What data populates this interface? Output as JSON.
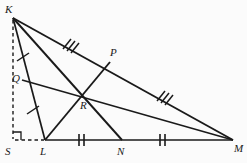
{
  "figure": {
    "width": 247,
    "height": 163,
    "background_color": "#fbfbfb",
    "stroke_color": "#1a1a1a",
    "label_color": "#1a1a1a"
  },
  "points": {
    "K": {
      "label": "K",
      "x": 13,
      "y": 18,
      "label_x": 5,
      "label_y": 4
    },
    "L": {
      "label": "L",
      "x": 45,
      "y": 140,
      "label_x": 40,
      "label_y": 146
    },
    "M": {
      "label": "M",
      "x": 233,
      "y": 140,
      "label_x": 234,
      "label_y": 143
    },
    "N": {
      "label": "N",
      "x": 122,
      "y": 140,
      "label_x": 117,
      "label_y": 146
    },
    "P": {
      "label": "P",
      "x": 110,
      "y": 62,
      "label_x": 110,
      "label_y": 47
    },
    "Q": {
      "label": "Q",
      "x": 22,
      "y": 80,
      "label_x": 12,
      "label_y": 73
    },
    "R": {
      "label": "R",
      "x": 85,
      "y": 96,
      "label_x": 80,
      "label_y": 100
    },
    "S": {
      "label": "S",
      "x": 13,
      "y": 140,
      "label_x": 5,
      "label_y": 146
    }
  },
  "segments": {
    "side_KL": {
      "name": "KL",
      "from": "K",
      "to": "L",
      "style": "solid"
    },
    "side_LM": {
      "name": "LM",
      "from": "L",
      "to": "M",
      "style": "solid"
    },
    "side_KM": {
      "name": "KM",
      "from": "K",
      "to": "M",
      "style": "solid"
    },
    "median_KN": {
      "name": "KN",
      "from": "K",
      "to": "N",
      "style": "solid"
    },
    "median_LP": {
      "name": "LP",
      "from": "L",
      "to": "P",
      "style": "solid"
    },
    "median_QM": {
      "name": "QM",
      "from": "Q",
      "to": "M",
      "style": "solid"
    },
    "altitude_KS": {
      "name": "KS",
      "from": "K",
      "to": "S",
      "style": "dashed"
    },
    "base_SL": {
      "name": "SL",
      "from": "S",
      "to": "L",
      "style": "dashed"
    }
  },
  "tick_marks": {
    "single": {
      "count": 1,
      "segments": [
        "KQ",
        "QL"
      ],
      "meaning": "KQ = QL"
    },
    "double": {
      "count": 2,
      "segments": [
        "LN",
        "NM"
      ],
      "meaning": "LN = NM"
    },
    "triple": {
      "count": 3,
      "segments": [
        "KP",
        "PM"
      ],
      "meaning": "KP = PM"
    }
  },
  "right_angle": {
    "at": "S",
    "marker": "right-angle-square",
    "size": 8
  }
}
